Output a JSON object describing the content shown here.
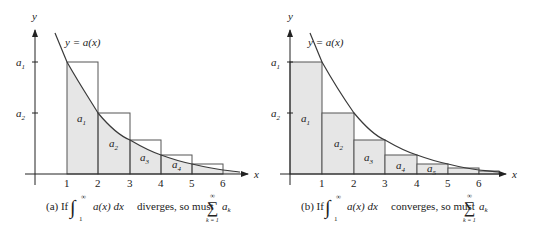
{
  "figure": {
    "panels": [
      {
        "id": "a",
        "curve_label": "y = a(x)",
        "axis_x": "x",
        "axis_y": "y",
        "y_ticks": [
          "a1",
          "a2"
        ],
        "x_ticks": [
          "1",
          "2",
          "3",
          "4",
          "5",
          "6"
        ],
        "rect_labels": [
          "a1",
          "a2",
          "a3",
          "a4"
        ],
        "rect_mode": "left-endpoint (upper sum, rectangles above curve)",
        "caption": {
          "prefix": "(a) If",
          "integral_lower": "1",
          "integral_upper": "∞",
          "integrand": "a(x) dx",
          "middle": "diverges, so must",
          "sum_lower": "k = 1",
          "sum_upper": "∞",
          "summand": "a",
          "summand_sub": "k"
        }
      },
      {
        "id": "b",
        "curve_label": "y = a(x)",
        "axis_x": "x",
        "axis_y": "y",
        "y_ticks": [
          "a1",
          "a2"
        ],
        "x_ticks": [
          "1",
          "2",
          "3",
          "4",
          "5",
          "6"
        ],
        "rect_labels": [
          "a1",
          "a2",
          "a3",
          "a4",
          "a5"
        ],
        "rect_mode": "right-endpoint (lower sum, rectangles below curve)",
        "caption": {
          "prefix": "(b) If",
          "integral_lower": "1",
          "integral_upper": "∞",
          "integrand": "a(x) dx",
          "middle": "converges, so must",
          "sum_lower": "k = 1",
          "sum_upper": "∞",
          "summand": "a",
          "summand_sub": "k"
        }
      }
    ],
    "colors": {
      "fill": "#e6e6e6",
      "stroke": "#4a4a4a",
      "curve": "#3a3a3a",
      "text": "#222222"
    }
  }
}
